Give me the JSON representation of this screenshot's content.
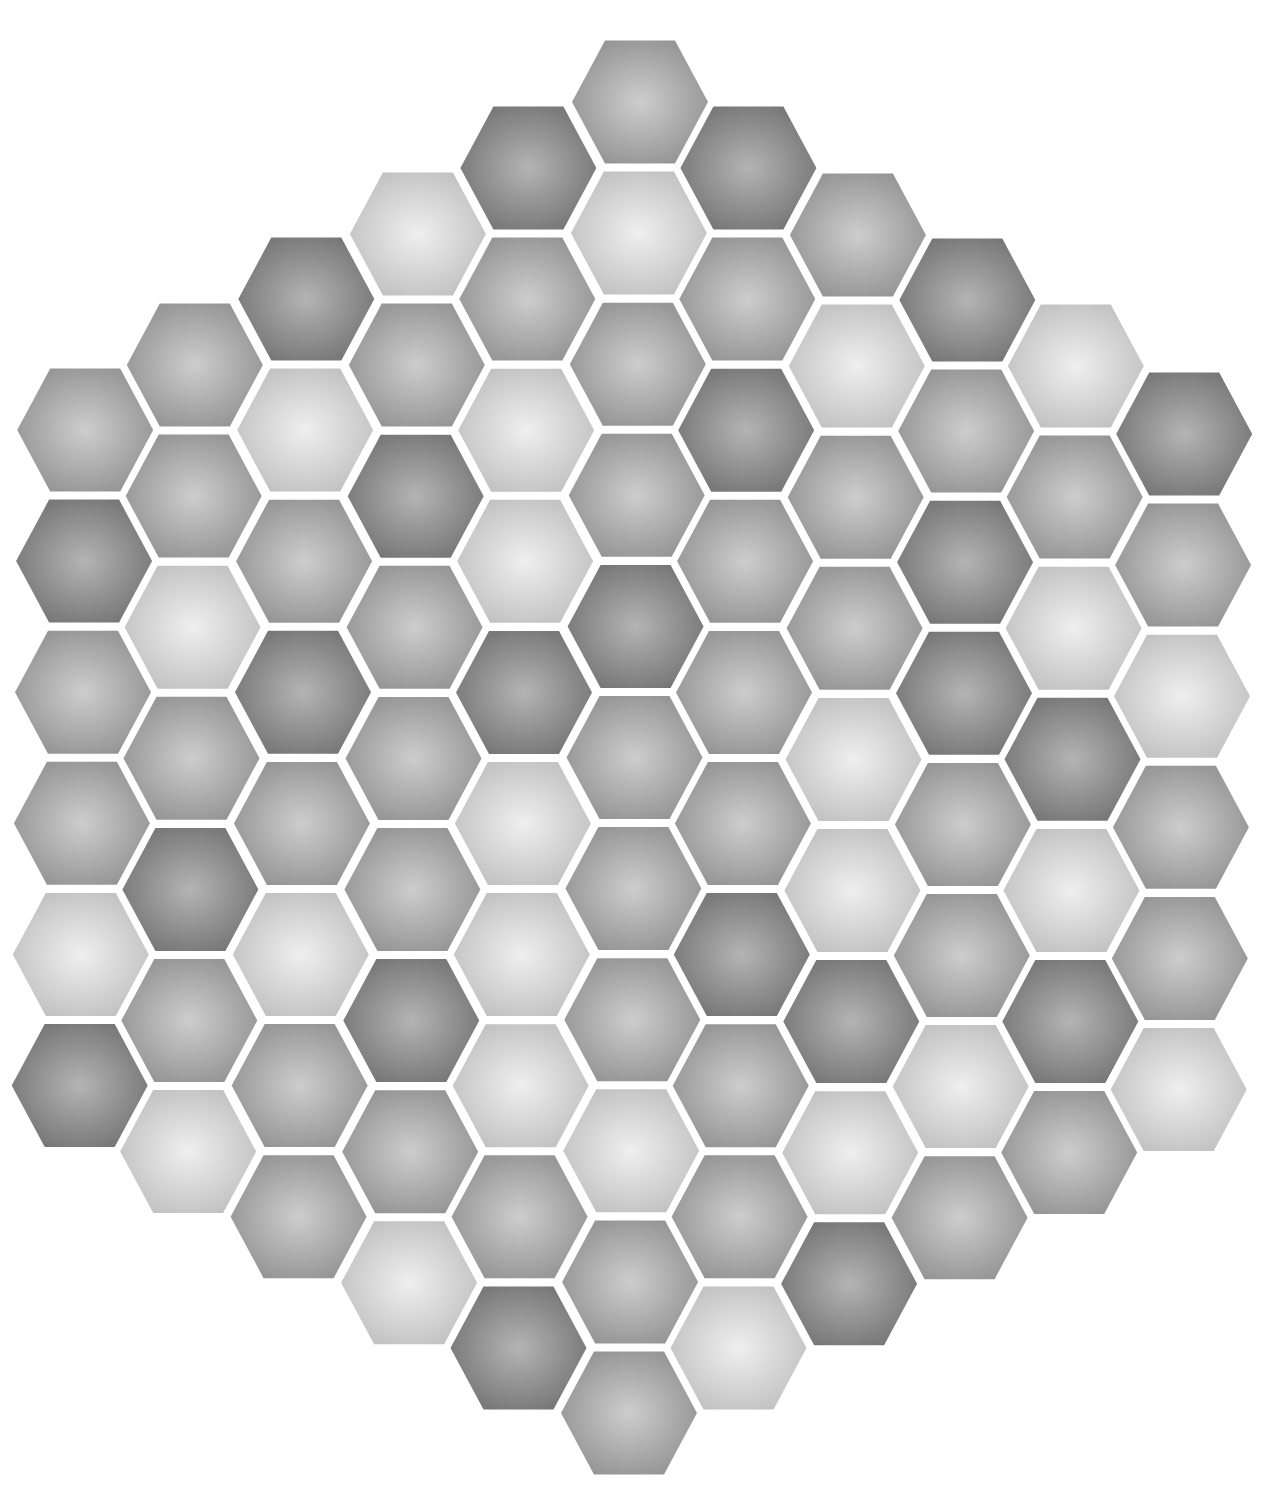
{
  "board": {
    "shape": "hexagon-of-hexagons",
    "orientation": "flat-top",
    "radius": 5,
    "tile_count": 91,
    "palette": {
      "D": {
        "name": "dark",
        "center": "#b4b4b4",
        "edge": "#777777"
      },
      "M": {
        "name": "medium",
        "center": "#cdcdcd",
        "edge": "#959595"
      },
      "L": {
        "name": "light",
        "center": "#efefef",
        "edge": "#c2c2c2"
      }
    },
    "gap_color": "#ffffff",
    "columns": [
      {
        "x": 88,
        "top_y": 430,
        "tiles": [
          "M",
          "D",
          "M",
          "M",
          "L",
          "D"
        ]
      },
      {
        "x": 197,
        "top_y": 365,
        "tiles": [
          "M",
          "M",
          "L",
          "M",
          "D",
          "M",
          "L"
        ]
      },
      {
        "x": 308,
        "top_y": 299,
        "tiles": [
          "D",
          "L",
          "M",
          "D",
          "M",
          "L",
          "M",
          "M"
        ]
      },
      {
        "x": 419,
        "top_y": 234,
        "tiles": [
          "L",
          "M",
          "D",
          "M",
          "M",
          "M",
          "D",
          "M",
          "L"
        ]
      },
      {
        "x": 529,
        "top_y": 168,
        "tiles": [
          "D",
          "M",
          "L",
          "L",
          "D",
          "L",
          "L",
          "L",
          "M",
          "D"
        ]
      },
      {
        "x": 640,
        "top_y": 102,
        "tiles": [
          "M",
          "L",
          "M",
          "M",
          "D",
          "M",
          "M",
          "M",
          "L",
          "M",
          "M"
        ]
      },
      {
        "x": 749,
        "top_y": 168,
        "tiles": [
          "D",
          "M",
          "D",
          "M",
          "M",
          "M",
          "D",
          "M",
          "M",
          "L"
        ]
      },
      {
        "x": 859,
        "top_y": 235,
        "tiles": [
          "M",
          "L",
          "M",
          "M",
          "L",
          "L",
          "D",
          "L",
          "D"
        ]
      },
      {
        "x": 969,
        "top_y": 300,
        "tiles": [
          "D",
          "M",
          "D",
          "D",
          "M",
          "M",
          "L",
          "M"
        ]
      },
      {
        "x": 1078,
        "top_y": 366,
        "tiles": [
          "L",
          "M",
          "L",
          "D",
          "L",
          "D",
          "M"
        ]
      },
      {
        "x": 1187,
        "top_y": 434,
        "tiles": [
          "D",
          "M",
          "L",
          "M",
          "M",
          "L"
        ]
      }
    ],
    "row_step": 131.1,
    "x_drift_per_row": -1.1,
    "tile_half_width": 68,
    "tile_half_height": 61.5,
    "tile_top_half_width": 35
  }
}
